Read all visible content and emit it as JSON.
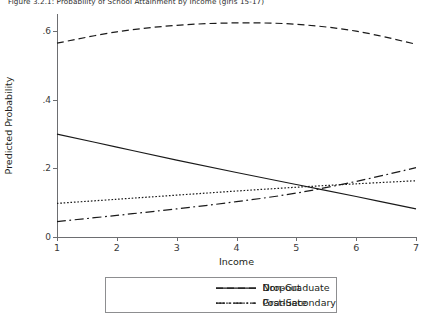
{
  "figure": {
    "title": "Figure 3.2.1: Probability of School Attainment by Income (girls 15-17)"
  },
  "chart_data": {
    "type": "line",
    "title": "Figure 3.2.1: Probability of School Attainment by Income (girls 15-17)",
    "xlabel": "Income",
    "ylabel": "Predicted Probability",
    "x": [
      1,
      2,
      3,
      4,
      5,
      6,
      7
    ],
    "xlim": [
      1,
      7
    ],
    "ylim": [
      0,
      0.65
    ],
    "yticks": [
      0,
      0.2,
      0.4,
      0.6
    ],
    "ytick_labels": [
      "0",
      ".2",
      ".4",
      ".6"
    ],
    "xticks": [
      1,
      2,
      3,
      4,
      5,
      6,
      7
    ],
    "xtick_labels": [
      "1",
      "2",
      "3",
      "4",
      "5",
      "6",
      "7"
    ],
    "grid": false,
    "legend_position": "below",
    "series": [
      {
        "name": "Dropout",
        "dash": "solid",
        "values": [
          0.3,
          0.262,
          0.224,
          0.188,
          0.153,
          0.118,
          0.082
        ]
      },
      {
        "name": "Non-Graduate",
        "dash": "dashed",
        "values": [
          0.565,
          0.598,
          0.617,
          0.624,
          0.62,
          0.6,
          0.562
        ]
      },
      {
        "name": "Graduate",
        "dash": "dotted",
        "values": [
          0.098,
          0.11,
          0.122,
          0.134,
          0.145,
          0.155,
          0.164
        ]
      },
      {
        "name": "Post-Secondary",
        "dash": "dash-dot",
        "values": [
          0.045,
          0.063,
          0.082,
          0.103,
          0.128,
          0.162,
          0.202
        ]
      }
    ]
  },
  "legend": {
    "items": [
      {
        "label": "Dropout",
        "dash": "solid"
      },
      {
        "label": "Non-Graduate",
        "dash": "dashed"
      },
      {
        "label": "Graduate",
        "dash": "dotted"
      },
      {
        "label": "Post-Secondary",
        "dash": "dash-dot"
      }
    ]
  }
}
